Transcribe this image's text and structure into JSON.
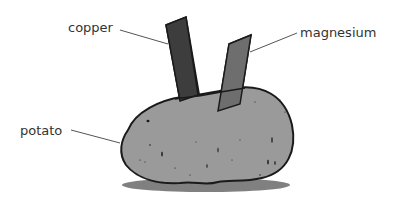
{
  "diagram": {
    "labels": {
      "copper": "copper",
      "magnesium": "magnesium",
      "potato": "potato"
    },
    "colors": {
      "copper_electrode": "#3d3d3d",
      "magnesium_electrode": "#6e6e6e",
      "potato_fill": "#9a9a9a",
      "outline": "#1a1a1a",
      "shadow": "#6a6a6a",
      "leader_line": "#555555",
      "label_text": "#333333"
    }
  }
}
